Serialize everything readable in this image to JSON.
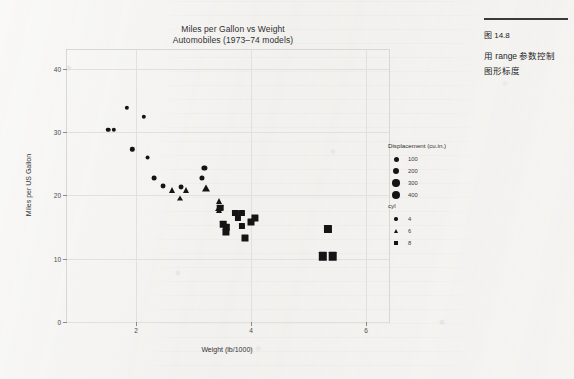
{
  "figure": {
    "title_line1": "Miles per Gallon vs Weight",
    "title_line2": "Automobiles (1973–74 models)"
  },
  "caption": {
    "number": "图 14.8",
    "line1": "用 range 参数控制",
    "line2": "图形标度"
  },
  "legend_size": {
    "title": "Displacement (cu.in.)",
    "items": [
      {
        "label": "100",
        "size": 5.0
      },
      {
        "label": "200",
        "size": 6.2
      },
      {
        "label": "300",
        "size": 7.4
      },
      {
        "label": "400",
        "size": 8.6
      }
    ]
  },
  "legend_shape": {
    "title": "cyl",
    "items": [
      {
        "label": "4",
        "shape": "circle"
      },
      {
        "label": "6",
        "shape": "triangle"
      },
      {
        "label": "8",
        "shape": "square"
      }
    ]
  },
  "chart_data": {
    "type": "scatter",
    "title": "Miles per Gallon vs Weight",
    "subtitle": "Automobiles (1973–74 models)",
    "xlabel": "Weight (lb/1000)",
    "ylabel": "Miles per US Gallon",
    "xlim": [
      0.8,
      6.4
    ],
    "ylim": [
      0,
      43
    ],
    "xticks": [
      2,
      4,
      6
    ],
    "yticks": [
      0,
      10,
      20,
      30,
      40
    ],
    "grid": true,
    "legend_position": "right",
    "size_encoding": "Displacement (cu.in.)",
    "shape_encoding": "cyl",
    "points": [
      {
        "x": 1.513,
        "y": 30.4,
        "cyl": 4,
        "disp": 95,
        "shape": "circle",
        "size": 4.6
      },
      {
        "x": 1.615,
        "y": 30.4,
        "cyl": 4,
        "disp": 79,
        "shape": "circle",
        "size": 4.4
      },
      {
        "x": 1.835,
        "y": 33.9,
        "cyl": 4,
        "disp": 71,
        "shape": "circle",
        "size": 4.3
      },
      {
        "x": 1.935,
        "y": 27.3,
        "cyl": 4,
        "disp": 79,
        "shape": "circle",
        "size": 4.4
      },
      {
        "x": 2.14,
        "y": 32.4,
        "cyl": 4,
        "disp": 79,
        "shape": "circle",
        "size": 4.4
      },
      {
        "x": 2.2,
        "y": 26.0,
        "cyl": 4,
        "disp": 120,
        "shape": "circle",
        "size": 4.9
      },
      {
        "x": 2.32,
        "y": 22.8,
        "cyl": 4,
        "disp": 108,
        "shape": "circle",
        "size": 4.8
      },
      {
        "x": 2.465,
        "y": 21.5,
        "cyl": 4,
        "disp": 120,
        "shape": "circle",
        "size": 4.9
      },
      {
        "x": 2.62,
        "y": 21.0,
        "cyl": 6,
        "disp": 160,
        "shape": "triangle",
        "size": 5.4
      },
      {
        "x": 2.77,
        "y": 19.7,
        "cyl": 6,
        "disp": 145,
        "shape": "triangle",
        "size": 5.2
      },
      {
        "x": 2.78,
        "y": 21.4,
        "cyl": 4,
        "disp": 121,
        "shape": "circle",
        "size": 4.9
      },
      {
        "x": 2.875,
        "y": 21.0,
        "cyl": 6,
        "disp": 160,
        "shape": "triangle",
        "size": 5.4
      },
      {
        "x": 3.15,
        "y": 22.8,
        "cyl": 4,
        "disp": 141,
        "shape": "circle",
        "size": 5.1
      },
      {
        "x": 3.19,
        "y": 24.4,
        "cyl": 4,
        "disp": 147,
        "shape": "circle",
        "size": 5.2
      },
      {
        "x": 3.215,
        "y": 21.4,
        "cyl": 6,
        "disp": 258,
        "shape": "triangle",
        "size": 6.6
      },
      {
        "x": 3.44,
        "y": 18.1,
        "cyl": 6,
        "disp": 225,
        "shape": "triangle",
        "size": 6.2
      },
      {
        "x": 3.44,
        "y": 19.2,
        "cyl": 6,
        "disp": 168,
        "shape": "triangle",
        "size": 5.5
      },
      {
        "x": 3.44,
        "y": 17.8,
        "cyl": 6,
        "disp": 168,
        "shape": "triangle",
        "size": 5.5
      },
      {
        "x": 3.46,
        "y": 18.1,
        "cyl": 8,
        "disp": 318,
        "shape": "square",
        "size": 6.6
      },
      {
        "x": 3.52,
        "y": 15.5,
        "cyl": 8,
        "disp": 318,
        "shape": "square",
        "size": 6.6
      },
      {
        "x": 3.57,
        "y": 14.3,
        "cyl": 8,
        "disp": 360,
        "shape": "square",
        "size": 7.1
      },
      {
        "x": 3.57,
        "y": 15.0,
        "cyl": 8,
        "disp": 301,
        "shape": "square",
        "size": 6.4
      },
      {
        "x": 3.73,
        "y": 17.3,
        "cyl": 8,
        "disp": 275,
        "shape": "square",
        "size": 6.1
      },
      {
        "x": 3.78,
        "y": 16.4,
        "cyl": 8,
        "disp": 275,
        "shape": "square",
        "size": 6.1
      },
      {
        "x": 3.84,
        "y": 15.2,
        "cyl": 8,
        "disp": 275,
        "shape": "square",
        "size": 6.1
      },
      {
        "x": 3.845,
        "y": 17.3,
        "cyl": 8,
        "disp": 276,
        "shape": "square",
        "size": 6.1
      },
      {
        "x": 4.07,
        "y": 16.4,
        "cyl": 8,
        "disp": 360,
        "shape": "square",
        "size": 7.1
      },
      {
        "x": 3.9,
        "y": 13.3,
        "cyl": 8,
        "disp": 350,
        "shape": "square",
        "size": 7.0
      },
      {
        "x": 4.0,
        "y": 15.8,
        "cyl": 8,
        "disp": 351,
        "shape": "square",
        "size": 7.0
      },
      {
        "x": 5.25,
        "y": 10.4,
        "cyl": 8,
        "disp": 460,
        "shape": "square",
        "size": 8.4
      },
      {
        "x": 5.345,
        "y": 14.7,
        "cyl": 8,
        "disp": 440,
        "shape": "square",
        "size": 8.1
      },
      {
        "x": 5.424,
        "y": 10.4,
        "cyl": 8,
        "disp": 472,
        "shape": "square",
        "size": 8.6
      }
    ]
  }
}
